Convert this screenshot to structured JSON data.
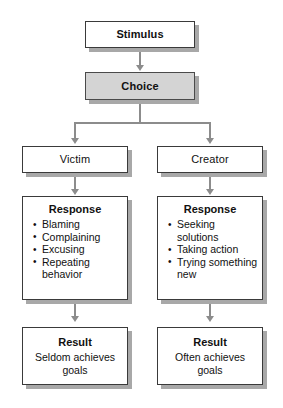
{
  "diagram": {
    "colors": {
      "box_border": "#3a3a3a",
      "box_fill": "#ffffff",
      "highlight_fill": "#d4d4d4",
      "shadow": "#a8a8a8",
      "connector": "#8c8c8c"
    },
    "stimulus": {
      "label": "Stimulus"
    },
    "choice": {
      "label": "Choice"
    },
    "branches": [
      {
        "role": "Victim",
        "response_heading": "Response",
        "response_items": [
          "Blaming",
          "Complaining",
          "Excusing",
          "Repeating behavior"
        ],
        "result_heading": "Result",
        "result_text": "Seldom achieves goals"
      },
      {
        "role": "Creator",
        "response_heading": "Response",
        "response_items": [
          "Seeking solutions",
          "Taking action",
          "Trying something new"
        ],
        "result_heading": "Result",
        "result_text": "Often achieves goals"
      }
    ]
  }
}
